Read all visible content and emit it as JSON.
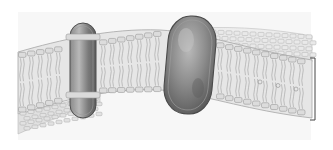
{
  "figure": {
    "components": [
      {
        "name": "lipid-bilayer",
        "description": "curved sheet of phospholipids with heads and tails"
      },
      {
        "name": "small-transmembrane-protein",
        "description": "narrow protein spanning the bilayer, left"
      },
      {
        "name": "large-transmembrane-protein",
        "description": "large oval protein spanning the bilayer, center"
      },
      {
        "name": "membrane-thickness-bracket",
        "description": "bracket indicating bilayer thickness, right edge"
      }
    ],
    "colors": {
      "background": "#ffffff",
      "bilayer_fill": "#e4e4e4",
      "head_fill": "#dcdcdc",
      "head_stroke": "#9a9a9a",
      "tail_stroke": "#a0a0a0",
      "protein_dark": "#6a6a6a",
      "protein_light": "#b5b5b5",
      "bracket": "#444444"
    },
    "labels": []
  }
}
